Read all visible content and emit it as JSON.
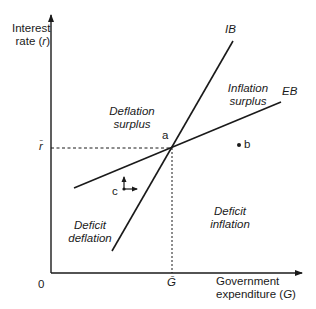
{
  "diagram": {
    "axes": {
      "y_label_line1": "Interest",
      "y_label_line2_prefix": "rate (",
      "y_label_var": "r",
      "y_label_line2_suffix": ")",
      "x_label_line1": "Government",
      "x_label_line2_prefix": "expenditure (",
      "x_label_var": "G",
      "x_label_line2_suffix": ")",
      "origin": "0",
      "r_bar": "r̄",
      "g_bar": "Ḡ"
    },
    "curves": {
      "ib": "IB",
      "eb": "EB"
    },
    "regions": {
      "deflation_surplus": [
        "Deflation",
        "surplus"
      ],
      "inflation_surplus": [
        "Inflation",
        "surplus"
      ],
      "deficit_deflation": [
        "Deficit",
        "deflation"
      ],
      "deficit_inflation": [
        "Deficit",
        "inflation"
      ]
    },
    "points": {
      "a": "a",
      "b": "b",
      "c": "c"
    },
    "colors": {
      "line": "#1a1a1a",
      "background": "#ffffff"
    }
  }
}
